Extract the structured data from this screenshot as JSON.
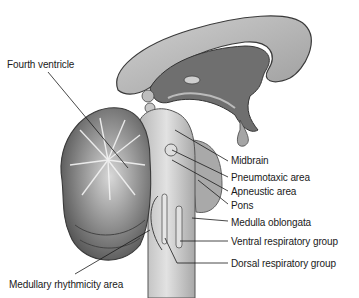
{
  "figure": {
    "colors": {
      "background": "#ffffff",
      "tissue_light": "#c9c9c9",
      "tissue_mid": "#9a9a9a",
      "tissue_dark": "#5e5e5e",
      "outline": "#3a3a3a",
      "text": "#1a1a1a"
    },
    "labels": [
      {
        "id": "fourth-ventricle",
        "text": "Fourth ventricle",
        "x": 7,
        "y": 59
      },
      {
        "id": "midbrain",
        "text": "Midbrain",
        "x": 231,
        "y": 155
      },
      {
        "id": "pneumotaxic-area",
        "text": "Pneumotaxic area",
        "x": 231,
        "y": 172
      },
      {
        "id": "apneustic-area",
        "text": "Apneustic area",
        "x": 231,
        "y": 186
      },
      {
        "id": "pons",
        "text": "Pons",
        "x": 231,
        "y": 200
      },
      {
        "id": "medulla-oblongata",
        "text": "Medulla oblongata",
        "x": 231,
        "y": 217
      },
      {
        "id": "ventral-respiratory-group",
        "text": "Ventral respiratory group",
        "x": 231,
        "y": 237
      },
      {
        "id": "dorsal-respiratory-group",
        "text": "Dorsal respiratory group",
        "x": 231,
        "y": 259
      },
      {
        "id": "medullary-rhythmicity-area",
        "text": "Medullary rhythmicity area",
        "x": 9,
        "y": 279
      }
    ]
  }
}
